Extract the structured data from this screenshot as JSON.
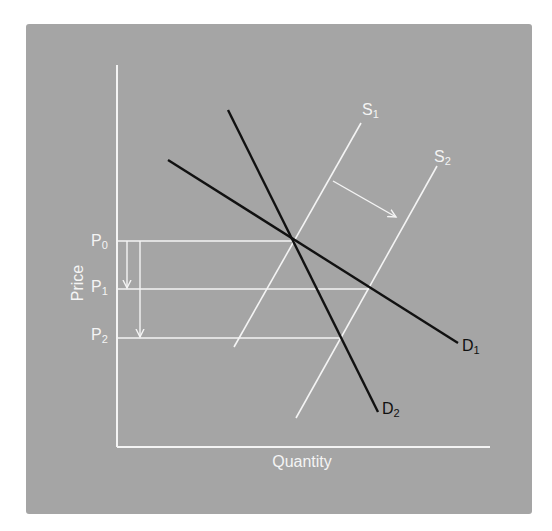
{
  "diagram": {
    "title": "",
    "type": "supply-demand",
    "panel_color": "#a5a5a5",
    "axis_color": "#f4f4f4",
    "axes": {
      "x_label": "Quantity",
      "y_label": "Price"
    },
    "price_levels": [
      {
        "id": "P0",
        "base": "P",
        "sub": "0"
      },
      {
        "id": "P1",
        "base": "P",
        "sub": "1"
      },
      {
        "id": "P2",
        "base": "P",
        "sub": "2"
      }
    ],
    "curves": {
      "S1": {
        "base": "S",
        "sub": "1",
        "color": "#f4f4f4",
        "kind": "supply"
      },
      "S2": {
        "base": "S",
        "sub": "2",
        "color": "#f4f4f4",
        "kind": "supply"
      },
      "D1": {
        "base": "D",
        "sub": "1",
        "color": "#111111",
        "kind": "demand",
        "elasticity": "more elastic"
      },
      "D2": {
        "base": "D",
        "sub": "2",
        "color": "#111111",
        "kind": "demand",
        "elasticity": "less elastic"
      }
    },
    "annotations": {
      "supply_shift_arrow": "rightward shift from S1 to S2",
      "price_drop_arrows": [
        "P0 to P1",
        "P0 to P2"
      ]
    }
  }
}
